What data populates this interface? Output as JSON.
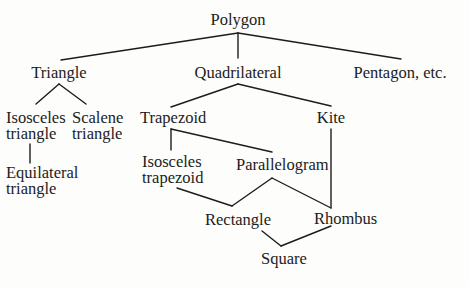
{
  "diagram": {
    "line_color": "#1c1c1c",
    "nodes": {
      "polygon": {
        "lines": [
          "Polygon"
        ]
      },
      "triangle": {
        "lines": [
          "Triangle"
        ]
      },
      "quadrilateral": {
        "lines": [
          "Quadrilateral"
        ]
      },
      "pentagon": {
        "lines": [
          "Pentagon, etc."
        ]
      },
      "isosceles_triangle": {
        "lines": [
          "Isosceles",
          "triangle"
        ]
      },
      "scalene_triangle": {
        "lines": [
          "Scalene",
          "triangle"
        ]
      },
      "equilateral_triangle": {
        "lines": [
          "Equilateral",
          "triangle"
        ]
      },
      "trapezoid": {
        "lines": [
          "Trapezoid"
        ]
      },
      "kite": {
        "lines": [
          "Kite"
        ]
      },
      "isosceles_trapezoid": {
        "lines": [
          "Isosceles",
          "trapezoid"
        ]
      },
      "parallelogram": {
        "lines": [
          "Parallelogram"
        ]
      },
      "rectangle": {
        "lines": [
          "Rectangle"
        ]
      },
      "rhombus": {
        "lines": [
          "Rhombus"
        ]
      },
      "square": {
        "lines": [
          "Square"
        ]
      }
    },
    "edges": [
      [
        "Polygon",
        "Triangle"
      ],
      [
        "Polygon",
        "Quadrilateral"
      ],
      [
        "Polygon",
        "Pentagon, etc."
      ],
      [
        "Triangle",
        "Isosceles triangle"
      ],
      [
        "Triangle",
        "Scalene triangle"
      ],
      [
        "Isosceles triangle",
        "Equilateral triangle"
      ],
      [
        "Quadrilateral",
        "Trapezoid"
      ],
      [
        "Quadrilateral",
        "Kite"
      ],
      [
        "Trapezoid",
        "Isosceles trapezoid"
      ],
      [
        "Trapezoid",
        "Parallelogram"
      ],
      [
        "Kite",
        "Rhombus"
      ],
      [
        "Parallelogram",
        "Rectangle"
      ],
      [
        "Parallelogram",
        "Rhombus"
      ],
      [
        "Isosceles trapezoid",
        "Rectangle"
      ],
      [
        "Rectangle",
        "Square"
      ],
      [
        "Rhombus",
        "Square"
      ]
    ]
  }
}
